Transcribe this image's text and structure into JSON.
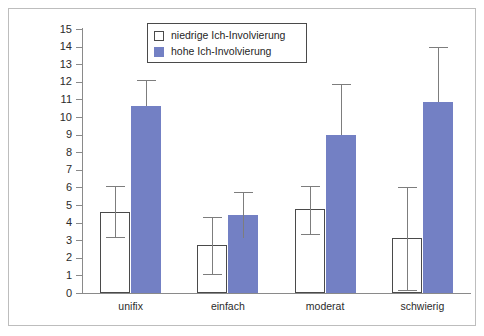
{
  "chart_data": {
    "type": "bar",
    "title": "",
    "subtitle": "",
    "xlabel": "",
    "ylabel": "",
    "categories": [
      "unifix",
      "einfach",
      "moderat",
      "schwierig"
    ],
    "ylim": [
      0,
      15
    ],
    "yticks": [
      0,
      1,
      2,
      3,
      4,
      5,
      6,
      7,
      8,
      9,
      10,
      11,
      12,
      13,
      14,
      15
    ],
    "ytick_labels": [
      "0",
      "1",
      "2",
      "3",
      "4",
      "5",
      "6",
      "7",
      "8",
      "9",
      "10",
      "11",
      "12",
      "13",
      "14",
      "15"
    ],
    "grid": false,
    "legend_position": "top-center",
    "series": [
      {
        "name": "niedrige Ich-Involvierung",
        "color": "#ffffff",
        "edge_color": "#4a4a4a",
        "values": [
          4.6,
          2.7,
          4.75,
          3.1
        ],
        "error_low": [
          3.2,
          1.1,
          3.35,
          0.15
        ],
        "error_high": [
          6.1,
          4.3,
          6.1,
          6.05
        ]
      },
      {
        "name": "hohe Ich-Involvierung",
        "color": "#7380c4",
        "edge_color": "#7380c4",
        "values": [
          10.6,
          4.45,
          8.95,
          10.85
        ],
        "error_low": [
          10.6,
          3.15,
          8.95,
          10.85
        ],
        "error_high": [
          12.1,
          5.75,
          11.85,
          14.0
        ]
      }
    ],
    "legend": [
      {
        "label": "niedrige Ich-Involvierung",
        "swatch": "white-square-outline"
      },
      {
        "label": "hohe Ich-Involvierung",
        "swatch": "blue-square-filled"
      }
    ],
    "colors": {
      "series_low": "#ffffff",
      "series_high": "#7380c4",
      "axis": "#8a8a8a",
      "error_bar": "#7d7d7d",
      "frame": "#bdbdbd",
      "text": "#2b2b2b"
    }
  }
}
